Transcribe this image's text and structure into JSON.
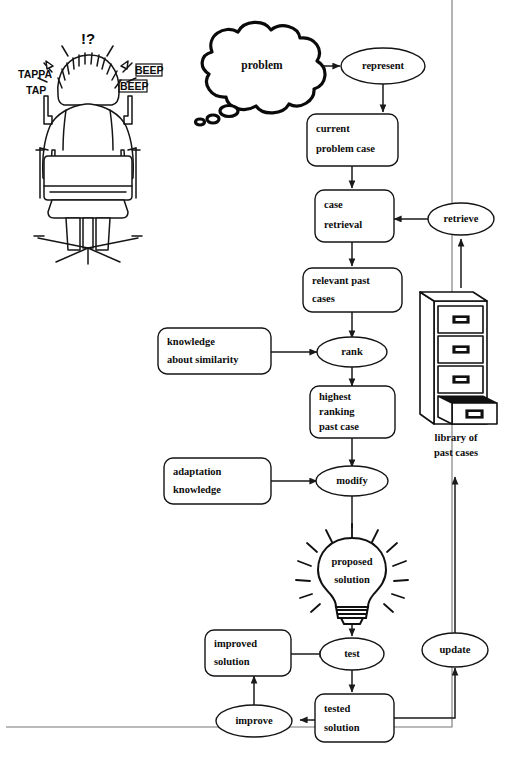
{
  "diagram": {
    "frame_color": "#777777",
    "ink_color": "#141414"
  },
  "illustration": {
    "name": "person-at-computer",
    "sfx": {
      "typing": "TAPPA",
      "typing2": "TAP",
      "confusion": "!?",
      "beep1": "BEEP",
      "beep2": "BEEP"
    }
  },
  "thought_cloud": {
    "label": "problem"
  },
  "process_nodes": [
    {
      "id": "represent",
      "label": "represent",
      "shape": "ellipse"
    },
    {
      "id": "retrieve",
      "label": "retrieve",
      "shape": "ellipse"
    },
    {
      "id": "rank",
      "label": "rank",
      "shape": "ellipse"
    },
    {
      "id": "modify",
      "label": "modify",
      "shape": "ellipse"
    },
    {
      "id": "test",
      "label": "test",
      "shape": "ellipse"
    },
    {
      "id": "improve",
      "label": "improve",
      "shape": "ellipse"
    },
    {
      "id": "update",
      "label": "update",
      "shape": "ellipse"
    }
  ],
  "data_boxes": [
    {
      "id": "current-problem-case",
      "line1": "current",
      "line2": "problem case",
      "line3": ""
    },
    {
      "id": "case-retrieval",
      "line1": "case",
      "line2": "retrieval",
      "line3": ""
    },
    {
      "id": "relevant-past-cases",
      "line1": "relevant past",
      "line2": "cases",
      "line3": ""
    },
    {
      "id": "knowledge-similarity",
      "line1": "knowledge",
      "line2": "about similarity",
      "line3": ""
    },
    {
      "id": "highest-ranking-past-case",
      "line1": "highest",
      "line2": "ranking",
      "line3": "past case"
    },
    {
      "id": "adaptation-knowledge",
      "line1": "adaptation",
      "line2": "knowledge",
      "line3": ""
    },
    {
      "id": "improved-solution",
      "line1": "improved",
      "line2": "solution",
      "line3": ""
    },
    {
      "id": "tested-solution",
      "line1": "tested",
      "line2": "solution",
      "line3": ""
    }
  ],
  "lightbulb": {
    "line1": "proposed",
    "line2": "solution"
  },
  "cabinet": {
    "caption_line1": "library of",
    "caption_line2": "past cases",
    "drawers": 4,
    "open_drawer_index": 4
  }
}
